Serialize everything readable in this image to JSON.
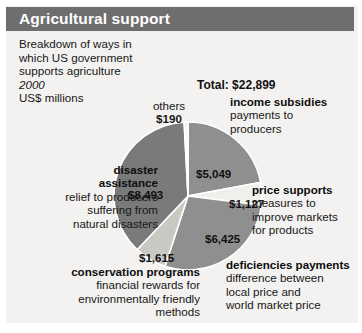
{
  "header": {
    "title": "Agricultural support"
  },
  "intro": {
    "line1": "Breakdown of ways in",
    "line2": "which US government",
    "line3": "supports agriculture",
    "year": "2000",
    "units": "US$ millions"
  },
  "total_label": "Total: $22,899",
  "chart_data": {
    "type": "pie",
    "title": "Agricultural support",
    "subtitle": "Breakdown of ways in which US government supports agriculture",
    "year": "2000",
    "units": "US$ millions",
    "total": 22899,
    "total_label": "Total: $22,899",
    "legend_position": "callouts",
    "categories": [
      "income subsidies",
      "price supports",
      "deficiencies payments",
      "conservation programs",
      "disaster assistance",
      "others"
    ],
    "values": [
      5049,
      1127,
      6425,
      1615,
      8493,
      190
    ],
    "value_labels": [
      "$5,049",
      "$1,127",
      "$6,425",
      "$1,615",
      "$8,493",
      "$190"
    ],
    "colors": [
      "#8f8f8f",
      "#efefec",
      "#8f8f8f",
      "#c9c9c4",
      "#7a7a7a",
      "#f4f4f1"
    ],
    "slice_order": "clockwise-from-top",
    "slices": [
      {
        "name": "income subsidies",
        "value": 5049,
        "value_label": "$5,049",
        "percent": 22.0,
        "color": "#8f8f8f",
        "title": "income subsidies",
        "description": [
          "payments to",
          "producers"
        ]
      },
      {
        "name": "price supports",
        "value": 1127,
        "value_label": "$1,127",
        "percent": 4.9,
        "color": "#efefec",
        "title": "price supports",
        "description": [
          "measures to",
          "improve markets",
          "for products"
        ]
      },
      {
        "name": "deficiencies payments",
        "value": 6425,
        "value_label": "$6,425",
        "percent": 28.1,
        "color": "#8f8f8f",
        "title": "deficiencies payments",
        "description": [
          "difference between",
          "local price and",
          "world market price"
        ]
      },
      {
        "name": "conservation programs",
        "value": 1615,
        "value_label": "$1,615",
        "percent": 7.1,
        "color": "#c9c9c4",
        "title": "conservation programs",
        "description": [
          "financial rewards for",
          "environmentally friendly",
          "methods"
        ]
      },
      {
        "name": "disaster assistance",
        "value": 8493,
        "value_label": "$8,493",
        "percent": 37.1,
        "color": "#7a7a7a",
        "title": "disaster assistance",
        "description": [
          "relief to producers",
          "suffering from",
          "natural disasters"
        ]
      },
      {
        "name": "others",
        "value": 190,
        "value_label": "$190",
        "percent": 0.8,
        "color": "#f4f4f1",
        "title": "others",
        "description": []
      }
    ]
  },
  "callouts": {
    "others": {
      "title": "others",
      "value": "$190"
    },
    "income": {
      "title": "income subsidies",
      "l1": "payments to",
      "l2": "producers"
    },
    "price": {
      "title": "price supports",
      "l1": "measures to",
      "l2": "improve markets",
      "l3": "for products"
    },
    "deficiencies": {
      "title": "deficiencies payments",
      "l1": "difference between",
      "l2": "local price and",
      "l3": "world market price"
    },
    "conservation": {
      "title": "conservation programs",
      "l1": "financial rewards for",
      "l2": "environmentally friendly",
      "l3": "methods"
    },
    "disaster": {
      "title1": "disaster",
      "title2": "assistance",
      "l1": "relief to producers",
      "l2": "suffering from",
      "l3": "natural disasters"
    }
  },
  "values": {
    "income": "$5,049",
    "price": "$1,127",
    "deficiencies": "$6,425",
    "conservation": "$1,615",
    "disaster": "$8,493"
  }
}
